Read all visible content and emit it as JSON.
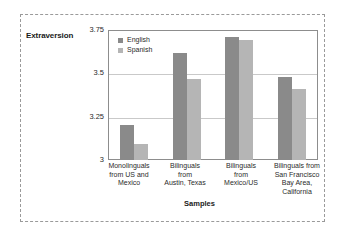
{
  "chart_data": {
    "type": "bar",
    "title": "",
    "xlabel": "Samples",
    "ylabel": "Extraversion",
    "ylim": [
      3,
      3.75
    ],
    "yticks": [
      "3",
      "3.25",
      "3.5",
      "3.75"
    ],
    "grid": true,
    "legend_position": "top-left-inside",
    "categories": [
      "Monolinguals from US and Mexico",
      "Bilinguals from Austin, Texas",
      "Bilinguals from Mexico/US",
      "Bilinguals from San Francisco Bay Area, California"
    ],
    "category_lines": [
      [
        "Monolinguals",
        "from US and",
        "Mexico"
      ],
      [
        "Bilinguals",
        "from",
        "Austin, Texas"
      ],
      [
        "Bilinguals",
        "from",
        "Mexico/US"
      ],
      [
        "Bilinguals from",
        "San Francisco",
        "Bay Area,",
        "California"
      ]
    ],
    "series": [
      {
        "name": "English",
        "color": "#8a8a8a",
        "values": [
          3.2,
          3.62,
          3.71,
          3.48
        ]
      },
      {
        "name": "Spanish",
        "color": "#b5b5b5",
        "values": [
          3.09,
          3.47,
          3.69,
          3.41
        ]
      }
    ]
  },
  "colors": {
    "english": "#8a8a8a",
    "spanish": "#b5b5b5",
    "grid": "#c9c9c9",
    "frame": "#8d8d8d",
    "outer_border": "#9a9a9a",
    "text": "#2b2b2b"
  }
}
